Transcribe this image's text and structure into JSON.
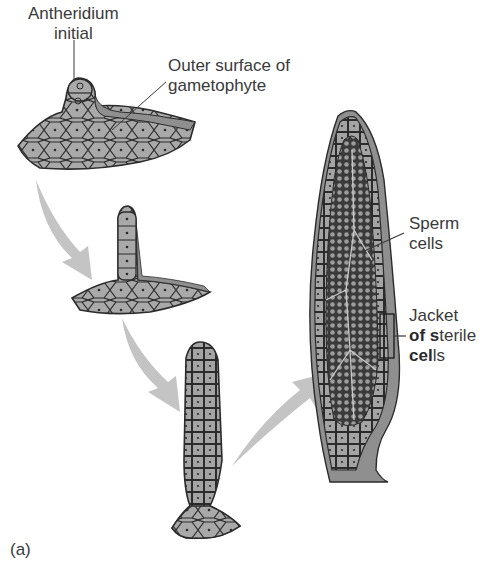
{
  "figure": {
    "panel_label": "(a)",
    "colors": {
      "tissue_fill": "#a9a9a9",
      "cell_outline": "#2b2b2b",
      "outer_surface": "#8f8f8f",
      "arrow_fill": "#c4c4c4",
      "background": "#ffffff",
      "text": "#3a3a3a"
    },
    "labels": {
      "antheridium_initial": {
        "line1": "Antheridium",
        "line2": "initial"
      },
      "outer_surface": {
        "line1": "Outer surface of",
        "line2": "gametophyte"
      },
      "sperm_cells": {
        "line1": "Sperm",
        "line2": "cells"
      },
      "jacket": {
        "line1": "Jacket",
        "line2_bold_a": "of",
        "line2_rest_a": " ",
        "line2_bold_b": "s",
        "line2_rest_b": "terile",
        "line3_bold": "cel",
        "line3_rest": "ls"
      }
    },
    "stages": [
      {
        "id": 1,
        "name": "Antheridium initial on gametophyte surface"
      },
      {
        "id": 2,
        "name": "Elongating single-cell column"
      },
      {
        "id": 3,
        "name": "Multicellular stalked antheridium"
      },
      {
        "id": 4,
        "name": "Mature antheridium with sperm cells and sterile jacket"
      }
    ],
    "arrows": [
      {
        "from": 1,
        "to": 2,
        "direction": "down-right"
      },
      {
        "from": 2,
        "to": 3,
        "direction": "down-right"
      },
      {
        "from": 3,
        "to": 4,
        "direction": "up-right"
      }
    ]
  }
}
